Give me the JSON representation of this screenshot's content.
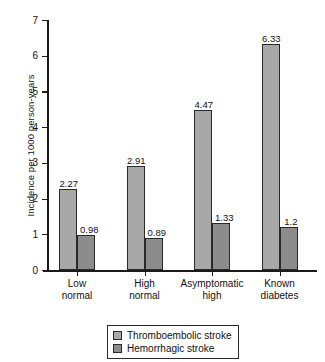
{
  "chart_data": {
    "type": "bar",
    "title": "",
    "xlabel": "",
    "ylabel": "Incidence per 1000 person-years",
    "ylim": [
      0,
      7
    ],
    "ytick_labels": [
      "0",
      "1",
      "2",
      "3",
      "4",
      "5",
      "6",
      "7"
    ],
    "grid": false,
    "legend_position": "bottom-center",
    "categories": [
      "Low normal",
      "High normal",
      "Asymptomatic high",
      "Known diabetes"
    ],
    "category_lines": [
      [
        "Low",
        "normal"
      ],
      [
        "High",
        "normal"
      ],
      [
        "Asymptomatic",
        "high"
      ],
      [
        "Known",
        "diabetes"
      ]
    ],
    "series": [
      {
        "name": "Thromboembolic stroke",
        "color": "#a8a8a8",
        "values": [
          2.27,
          2.91,
          4.47,
          6.33
        ],
        "labels": [
          "2.27",
          "2.91",
          "4.47",
          "6.33"
        ]
      },
      {
        "name": "Hemorrhagic stroke",
        "color": "#8c8c8c",
        "values": [
          0.98,
          0.89,
          1.33,
          1.2
        ],
        "labels": [
          "0.98",
          "0.89",
          "1.33",
          "1.2"
        ]
      }
    ]
  },
  "legend": {
    "items": [
      {
        "label": "Thromboembolic stroke",
        "color": "#a8a8a8"
      },
      {
        "label": "Hemorrhagic stroke",
        "color": "#8c8c8c"
      }
    ]
  },
  "colors": {
    "axis": "#1a1a1a",
    "bar_border": "#2a2a2a",
    "series_1": "#a8a8a8",
    "series_2": "#8c8c8c",
    "background": "#ffffff"
  }
}
